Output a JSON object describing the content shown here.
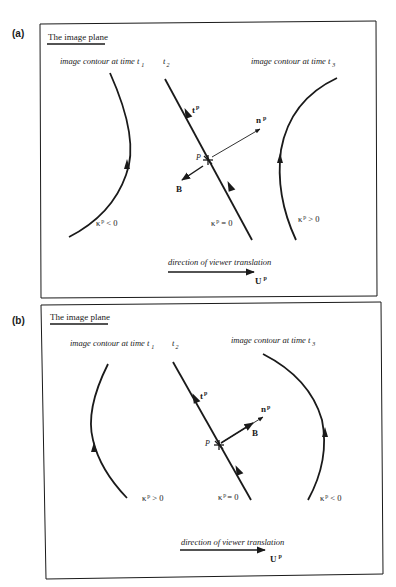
{
  "panels": [
    {
      "label": "(a)",
      "header": "The image plane",
      "contour_t1_label": "image contour at time t",
      "contour_t1_sub": "1",
      "t2_label": "t",
      "t2_sub": "2",
      "contour_t3_label": "image contour at time t",
      "contour_t3_sub": "3",
      "tangent_label": "t",
      "tangent_sup": "p",
      "normal_label": "n",
      "normal_sup": "p",
      "point_label": "P",
      "binormal_label": "B",
      "left_curvature": "κ",
      "left_curvature_sup": "p",
      "left_curvature_rel": "< 0",
      "middle_curvature": "κ",
      "middle_curvature_sup": "p",
      "middle_curvature_rel": "= 0",
      "right_curvature": "κ",
      "right_curvature_sup": "p",
      "right_curvature_rel": "> 0",
      "translation_label": "direction of viewer translation",
      "velocity_label": "U",
      "velocity_sup": "p"
    },
    {
      "label": "(b)",
      "header": "The image plane",
      "contour_t1_label": "image contour at time t",
      "contour_t1_sub": "1",
      "t2_label": "t",
      "t2_sub": "2",
      "contour_t3_label": "image contour at time t",
      "contour_t3_sub": "3",
      "tangent_label": "t",
      "tangent_sup": "p",
      "normal_label": "n",
      "normal_sup": "p",
      "point_label": "P",
      "binormal_label": "B",
      "left_curvature": "κ",
      "left_curvature_sup": "p",
      "left_curvature_rel": "> 0",
      "middle_curvature": "κ",
      "middle_curvature_sup": "p",
      "middle_curvature_rel": "= 0",
      "right_curvature": "κ",
      "right_curvature_sup": "p",
      "right_curvature_rel": "< 0",
      "translation_label": "direction of viewer translation",
      "velocity_label": "U",
      "velocity_sup": "p"
    }
  ],
  "colors": {
    "ink": "#1a1a1a",
    "background": "#ffffff"
  }
}
